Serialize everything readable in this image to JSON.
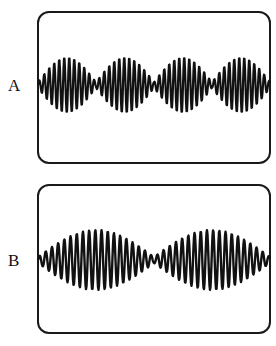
{
  "figure": {
    "panels": [
      {
        "label": "A",
        "description": "Beat pattern with four envelope lobes (larger frequency difference)",
        "box": {
          "x": 37,
          "y": 11,
          "w": 234,
          "h": 153
        },
        "label_pos": {
          "x": 8,
          "y": 77
        },
        "trace": {
          "x_start": 38,
          "x_end": 270,
          "center_y": 85,
          "amplitude": 28,
          "beats": 4,
          "carrier_period": 5.0,
          "min_ratio": 0.1
        }
      },
      {
        "label": "B",
        "description": "Beat pattern with two envelope lobes (smaller frequency difference)",
        "box": {
          "x": 37,
          "y": 184,
          "w": 234,
          "h": 150
        },
        "label_pos": {
          "x": 8,
          "y": 252
        },
        "trace": {
          "x_start": 38,
          "x_end": 270,
          "center_y": 260,
          "amplitude": 30,
          "beats": 2,
          "carrier_period": 6.2,
          "min_ratio": 0.1
        }
      }
    ],
    "stroke_color": "#111111"
  }
}
